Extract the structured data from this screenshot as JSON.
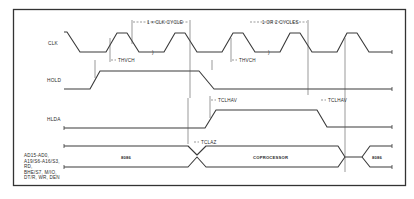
{
  "figure": {
    "type": "timing-diagram",
    "border_color": "#333333",
    "line_color": "#3a3a3a"
  },
  "signals": [
    {
      "name": "CLK"
    },
    {
      "name": "HOLD"
    },
    {
      "name": "HLDA"
    },
    {
      "name": "bus",
      "lines": [
        "AD15-AD0,",
        "A19/S6-A16/S3,",
        "RD,",
        "BHE/S7, M/IO,",
        "DT/R, WR, DEN"
      ]
    }
  ],
  "annotations": {
    "cycle_label": "1 × CLK CYCLE",
    "cycles_label": "1 OR 2 CYCLES",
    "thvch_1": "THVCH",
    "thvch_2": "THVCH",
    "tclhav_1": "TCLHAV",
    "tclhav_2": "TCLHAV",
    "tclaz": "TCLAZ"
  },
  "bus_phases": {
    "first": "8086",
    "middle": "COPROCESSOR",
    "last": "8086"
  }
}
